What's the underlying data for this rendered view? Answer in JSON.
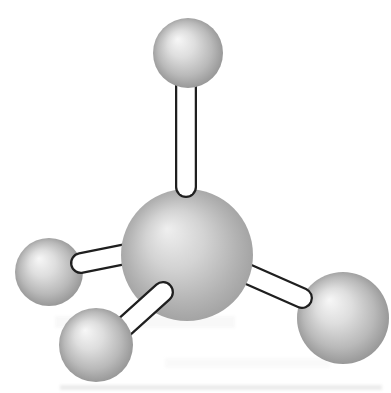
{
  "figure": {
    "canvas": {
      "width": 391,
      "height": 393,
      "background": "#ffffff"
    }
  },
  "colors": {
    "bond_fill": "#ffffff",
    "bond_outline": "#1f1f1f",
    "sphere_small_stops": [
      [
        "0%",
        "#f7f7f7"
      ],
      [
        "35%",
        "#dedede"
      ],
      [
        "70%",
        "#b9b9b9"
      ],
      [
        "100%",
        "#8f8f8f"
      ]
    ],
    "sphere_large_stops": [
      [
        "0%",
        "#efefef"
      ],
      [
        "40%",
        "#d3d3d3"
      ],
      [
        "75%",
        "#b3b3b3"
      ],
      [
        "100%",
        "#9e9e9e"
      ]
    ],
    "artifact": "#bfbfbf"
  },
  "molecule": {
    "atoms": [
      {
        "id": "left",
        "cx": 49,
        "cy": 272,
        "r": 34,
        "shade": "small"
      },
      {
        "id": "right",
        "cx": 343,
        "cy": 318,
        "r": 46,
        "shade": "small"
      },
      {
        "id": "central",
        "cx": 187,
        "cy": 255,
        "r": 66,
        "shade": "large"
      },
      {
        "id": "top",
        "cx": 188,
        "cy": 53,
        "r": 35,
        "shade": "small"
      },
      {
        "id": "bottom",
        "cx": 96,
        "cy": 345,
        "r": 37,
        "shade": "small"
      }
    ],
    "bonds": [
      {
        "id": "top",
        "x1": 186,
        "y1": 62,
        "x2": 186,
        "y2": 187,
        "outer_width": 22,
        "inner_width": 17.5
      },
      {
        "id": "left",
        "x1": 136,
        "y1": 252,
        "x2": 81,
        "y2": 263,
        "outer_width": 22,
        "inner_width": 17.5
      },
      {
        "id": "right",
        "x1": 243,
        "y1": 272,
        "x2": 302,
        "y2": 298,
        "outer_width": 22,
        "inner_width": 17.5
      },
      {
        "id": "bottom",
        "x1": 112,
        "y1": 338,
        "x2": 163,
        "y2": 292,
        "outer_width": 22,
        "inner_width": 17.5
      }
    ],
    "draw_order": [
      "atom:left",
      "atom:right",
      "bond:left",
      "bond:right",
      "atom:central",
      "bond:top",
      "bond:bottom",
      "atom:top",
      "atom:bottom"
    ]
  },
  "scan_artifacts": [
    {
      "x": 60,
      "y": 385,
      "w": 322,
      "h": 5,
      "opacity": 0.3
    },
    {
      "x": 55,
      "y": 316,
      "w": 180,
      "h": 12,
      "opacity": 0.1
    },
    {
      "x": 165,
      "y": 358,
      "w": 165,
      "h": 10,
      "opacity": 0.08
    }
  ]
}
